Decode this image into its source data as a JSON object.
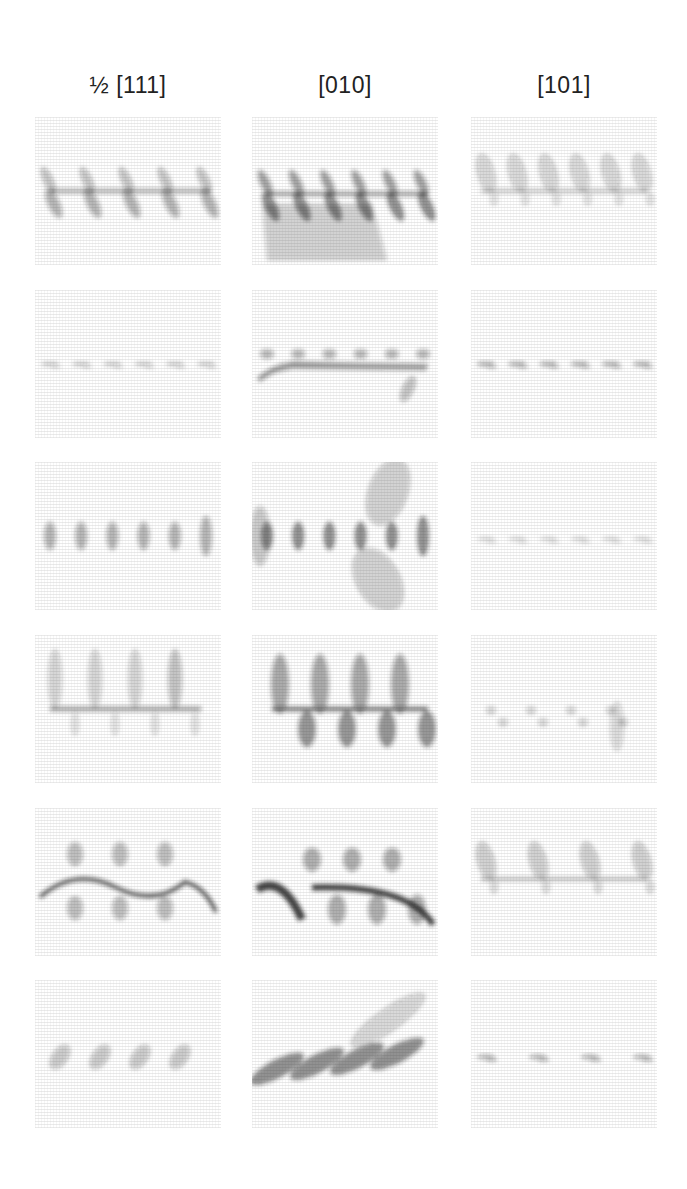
{
  "figure": {
    "column_labels": [
      "½ [111]",
      "[010]",
      "[101]"
    ],
    "columns_x": [
      35,
      252,
      471
    ],
    "rows_y": [
      117,
      290,
      462,
      635,
      808,
      980
    ],
    "panel_size": {
      "w": 186,
      "h": 148
    },
    "ink_color": "#1e1e1e",
    "background_hatch_color": "#d8d8d8",
    "rows": [
      {
        "index": 1,
        "panels": [
          {
            "column": "½ [111]",
            "motif": "diagonal-fringes",
            "count": 5,
            "density": 0.55,
            "line_y": 0.5,
            "tilt": 0.35
          },
          {
            "column": "[010]",
            "motif": "curved-fringes-with-shadow",
            "count": 6,
            "density": 0.85,
            "line_y": 0.52,
            "tilt": 0.35
          },
          {
            "column": "[101]",
            "motif": "lobes-above-line",
            "count": 6,
            "density": 0.5,
            "line_y": 0.5,
            "tilt": 0.1
          }
        ]
      },
      {
        "index": 2,
        "panels": [
          {
            "column": "½ [111]",
            "motif": "faint-dashes",
            "count": 6,
            "density": 0.3,
            "line_y": 0.5,
            "tilt": 0.0
          },
          {
            "column": "[010]",
            "motif": "dense-line-with-dashes",
            "count": 6,
            "density": 0.75,
            "line_y": 0.5,
            "tilt": 0.0
          },
          {
            "column": "[101]",
            "motif": "dashes",
            "count": 6,
            "density": 0.55,
            "line_y": 0.5,
            "tilt": 0.0
          }
        ]
      },
      {
        "index": 3,
        "panels": [
          {
            "column": "½ [111]",
            "motif": "vertical-blobs",
            "count": 6,
            "density": 0.55,
            "line_y": 0.5,
            "tilt": 0.0
          },
          {
            "column": "[010]",
            "motif": "vertical-blobs-with-halo",
            "count": 6,
            "density": 0.85,
            "line_y": 0.5,
            "tilt": 0.0
          },
          {
            "column": "[101]",
            "motif": "faint-dashes",
            "count": 6,
            "density": 0.25,
            "line_y": 0.52,
            "tilt": 0.0
          }
        ]
      },
      {
        "index": 4,
        "panels": [
          {
            "column": "½ [111]",
            "motif": "hooks-above-line",
            "count": 4,
            "density": 0.65,
            "line_y": 0.5,
            "tilt": 0.0
          },
          {
            "column": "[010]",
            "motif": "lobes-above-and-below",
            "count": 4,
            "density": 0.9,
            "line_y": 0.5,
            "tilt": 0.0
          },
          {
            "column": "[101]",
            "motif": "sparse-dots",
            "count": 4,
            "density": 0.35,
            "line_y": 0.55,
            "tilt": 0.0
          }
        ]
      },
      {
        "index": 5,
        "panels": [
          {
            "column": "½ [111]",
            "motif": "zigzag-with-blobs",
            "count": 3,
            "density": 0.7,
            "line_y": 0.5,
            "tilt": 0.0
          },
          {
            "column": "[010]",
            "motif": "arc-with-blobs",
            "count": 3,
            "density": 0.85,
            "line_y": 0.55,
            "tilt": 0.0
          },
          {
            "column": "[101]",
            "motif": "lobes-above-line",
            "count": 4,
            "density": 0.6,
            "line_y": 0.48,
            "tilt": 0.0
          }
        ]
      },
      {
        "index": 6,
        "panels": [
          {
            "column": "½ [111]",
            "motif": "faint-diagonal-clusters",
            "count": 4,
            "density": 0.4,
            "line_y": 0.52,
            "tilt": 0.3
          },
          {
            "column": "[010]",
            "motif": "diagonal-streaks",
            "count": 4,
            "density": 0.85,
            "line_y": 0.6,
            "tilt": -0.45
          },
          {
            "column": "[101]",
            "motif": "dashes",
            "count": 4,
            "density": 0.6,
            "line_y": 0.52,
            "tilt": 0.0
          }
        ]
      }
    ]
  }
}
